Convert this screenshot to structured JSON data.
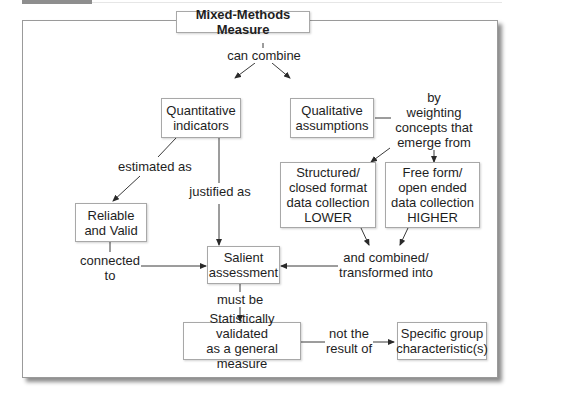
{
  "nodes": {
    "mixed": "Mixed-Methods Measure",
    "quant": [
      "Quantitative",
      "indicators"
    ],
    "qual": [
      "Qualitative",
      "assumptions"
    ],
    "structured": [
      "Structured/",
      "closed format",
      "data collection",
      "LOWER"
    ],
    "freeform": [
      "Free form/",
      "open ended",
      "data collection",
      "HIGHER"
    ],
    "reliable": [
      "Reliable",
      "and Valid"
    ],
    "salient": [
      "Salient",
      "assessment"
    ],
    "statistically": [
      "Statistically validated",
      "as a general measure"
    ],
    "specific": [
      "Specific group",
      "characteristic(s)"
    ]
  },
  "edge_labels": {
    "can_combine": "can combine",
    "by_weighting": [
      "by",
      "weighting",
      "concepts that",
      "emerge from"
    ],
    "estimated_as": "estimated as",
    "justified_as": "justified as",
    "connected_to": [
      "connected",
      "to"
    ],
    "combined_into": [
      "and combined/",
      "transformed into"
    ],
    "must_be": "must be",
    "not_result_of": [
      "not the",
      "result of"
    ]
  }
}
